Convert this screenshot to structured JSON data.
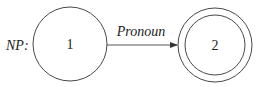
{
  "diagram": {
    "type": "finite-state-automaton",
    "network_label": "NP:",
    "states": [
      {
        "id": "1",
        "label": "1",
        "accepting": false
      },
      {
        "id": "2",
        "label": "2",
        "accepting": true
      }
    ],
    "transitions": [
      {
        "from": "1",
        "to": "2",
        "label": "Pronoun"
      }
    ],
    "colors": {
      "stroke": "#333333",
      "text": "#222222",
      "background": "#ffffff"
    }
  }
}
